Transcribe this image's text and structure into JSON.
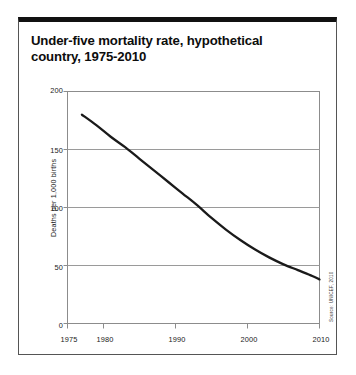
{
  "figure": {
    "title": "Under-five mortality rate, hypothetical\ncountry, 1975-2010",
    "source": "Source: UNICEF, 2010",
    "frame_color": "#111111",
    "line_color": "#1a1a1a",
    "grid_color": "#9a9a9a"
  },
  "chart_data": {
    "type": "line",
    "title": "Under-five mortality rate, hypothetical country, 1975-2010",
    "xlabel": "",
    "ylabel": "Deaths per 1,000 births",
    "xlim": [
      1975,
      2010
    ],
    "ylim": [
      0,
      200
    ],
    "xticks": [
      1975,
      1980,
      1990,
      2000,
      2010
    ],
    "xtick_labels": [
      "1975",
      "1980",
      "1990",
      "2000",
      "2010"
    ],
    "yticks": [
      0,
      50,
      100,
      150,
      200
    ],
    "ytick_labels": [
      "0",
      "50",
      "100",
      "150",
      "200"
    ],
    "grid": "horizontal",
    "legend": "none",
    "series": [
      {
        "name": "Under-five mortality rate",
        "x": [
          1977,
          1979,
          1981,
          1983,
          1985,
          1987,
          1989,
          1991,
          1993,
          1995,
          1997,
          1999,
          2001,
          2003,
          2005,
          2007,
          2009,
          2010
        ],
        "values": [
          180,
          171,
          161,
          152,
          142,
          132,
          122,
          112,
          102,
          91,
          81,
          72,
          64,
          57,
          51,
          46,
          41,
          38
        ]
      }
    ],
    "annotations": []
  }
}
